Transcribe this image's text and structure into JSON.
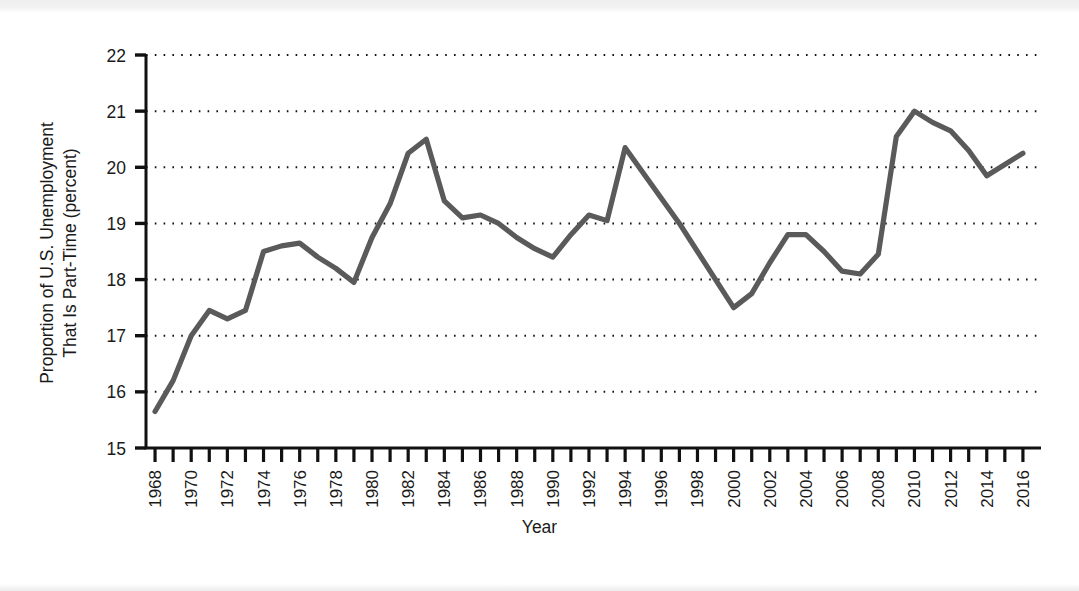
{
  "chart_data": {
    "type": "line",
    "title": "",
    "xlabel": "Year",
    "ylabel": "Proportion of U.S. Unemployment That Is Part-Time (percent)",
    "ylabel_line1": "Proportion of U.S. Unemployment",
    "ylabel_line2": "That Is Part-Time (percent)",
    "xlim": [
      1967.5,
      2017.0
    ],
    "ylim": [
      15,
      22
    ],
    "ytick_labels": [
      "22",
      "21",
      "20",
      "19",
      "18",
      "17",
      "16",
      "15"
    ],
    "yticks": [
      22,
      21,
      20,
      19,
      18,
      17,
      16,
      15
    ],
    "xtick_labels": [
      "1968",
      "1970",
      "1972",
      "1974",
      "1976",
      "1978",
      "1980",
      "1982",
      "1984",
      "1986",
      "1988",
      "1990",
      "1992",
      "1994",
      "1996",
      "1998",
      "2000",
      "2002",
      "2004",
      "2006",
      "2008",
      "2010",
      "2012",
      "2014",
      "2016"
    ],
    "xticks_major": [
      1968,
      1970,
      1972,
      1974,
      1976,
      1978,
      1980,
      1982,
      1984,
      1986,
      1988,
      1990,
      1992,
      1994,
      1996,
      1998,
      2000,
      2002,
      2004,
      2006,
      2008,
      2010,
      2012,
      2014,
      2016
    ],
    "grid": "horizontal-dotted",
    "legend": "none",
    "line_color": "#5a5a5a",
    "axis_color": "#111111",
    "x": [
      1968,
      1969,
      1970,
      1971,
      1972,
      1973,
      1974,
      1975,
      1976,
      1977,
      1978,
      1979,
      1980,
      1981,
      1982,
      1983,
      1984,
      1985,
      1986,
      1987,
      1988,
      1989,
      1990,
      1991,
      1992,
      1993,
      1994,
      1995,
      1996,
      1997,
      1998,
      1999,
      2000,
      2001,
      2002,
      2003,
      2004,
      2005,
      2006,
      2007,
      2008,
      2009,
      2010,
      2011,
      2012,
      2013,
      2014,
      2015,
      2016
    ],
    "series": [
      {
        "name": "Proportion of U.S. unemployment that is part-time",
        "values": [
          15.65,
          16.2,
          17.0,
          17.45,
          17.3,
          17.45,
          18.5,
          18.6,
          18.65,
          18.4,
          18.2,
          17.95,
          18.75,
          19.35,
          20.25,
          20.5,
          19.4,
          19.1,
          19.15,
          19.0,
          18.75,
          18.55,
          18.4,
          18.8,
          19.15,
          19.05,
          20.35,
          19.9,
          19.45,
          19.0,
          18.5,
          18.0,
          17.5,
          17.75,
          18.3,
          18.8,
          18.8,
          18.5,
          18.15,
          18.1,
          18.45,
          20.55,
          21.0,
          20.8,
          20.65,
          20.3,
          19.85,
          20.05,
          20.25
        ]
      }
    ]
  },
  "axis": {
    "y_title": "Proportion of U.S. Unemployment That Is Part-Time (percent)",
    "x_title": "Year"
  }
}
